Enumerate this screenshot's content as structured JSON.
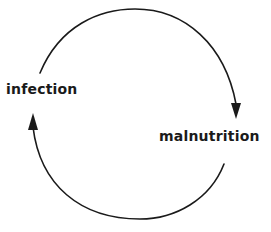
{
  "diagram": {
    "type": "cycle",
    "nodes": [
      {
        "id": "infection",
        "label": "infection"
      },
      {
        "id": "malnutrition",
        "label": "malnutrition"
      }
    ],
    "edges": [
      {
        "from": "infection",
        "to": "malnutrition",
        "direction": "clockwise-top"
      },
      {
        "from": "malnutrition",
        "to": "infection",
        "direction": "clockwise-bottom"
      }
    ]
  },
  "colors": {
    "stroke": "#1a1a1a",
    "background": "#ffffff"
  }
}
